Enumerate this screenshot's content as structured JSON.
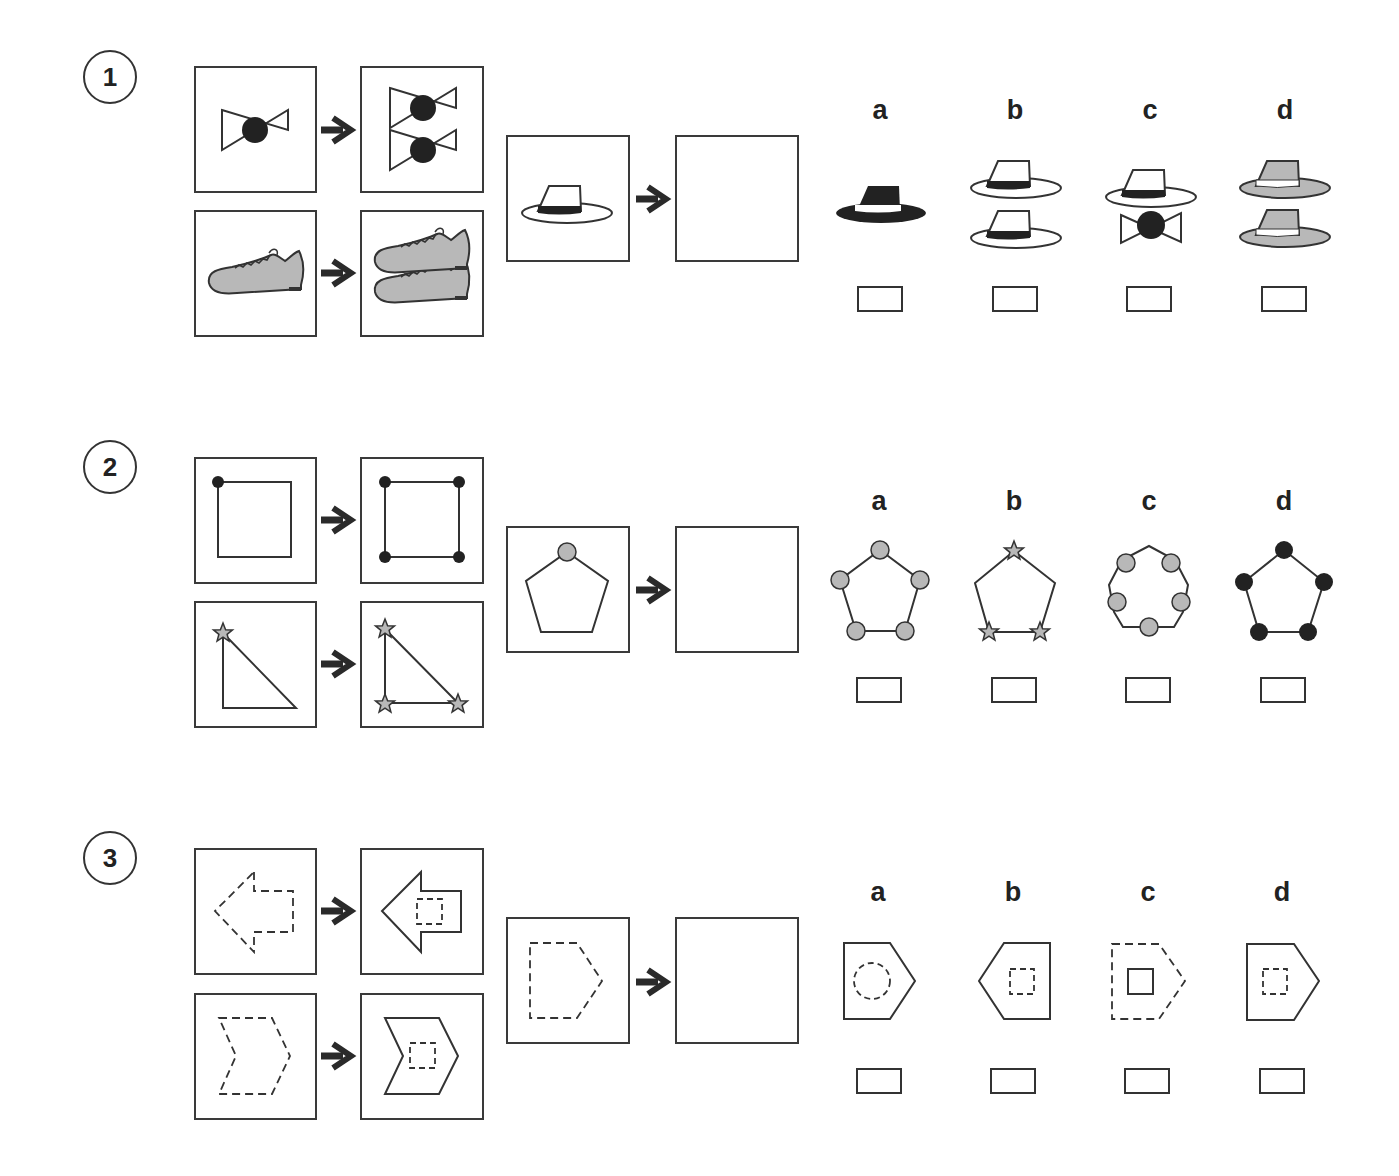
{
  "colors": {
    "stroke": "#333333",
    "black_fill": "#222222",
    "gray_fill": "#b8b8b8",
    "background": "#ffffff"
  },
  "questions": [
    {
      "number": "1",
      "examples": [
        {
          "from": "bow-tie",
          "to": "two bow-ties stacked"
        },
        {
          "from": "shoe",
          "to": "two shoes stacked"
        }
      ],
      "prompt": {
        "from": "white hat with black band",
        "to": ""
      },
      "options": [
        {
          "label": "a",
          "description": "single black hat with white band"
        },
        {
          "label": "b",
          "description": "two white hats with black bands stacked"
        },
        {
          "label": "c",
          "description": "white hat on top of bow-tie"
        },
        {
          "label": "d",
          "description": "two gray hats with white bands stacked"
        }
      ]
    },
    {
      "number": "2",
      "examples": [
        {
          "from": "square with black dot on one corner",
          "to": "square with black dots on all four corners"
        },
        {
          "from": "right triangle with gray star on one corner",
          "to": "right triangle with gray stars on all three corners"
        }
      ],
      "prompt": {
        "from": "pentagon with gray circle on top vertex",
        "to": ""
      },
      "options": [
        {
          "label": "a",
          "description": "pentagon with gray circles on all five vertices"
        },
        {
          "label": "b",
          "description": "pentagon with gray stars on three vertices"
        },
        {
          "label": "c",
          "description": "heptagon with gray circles on edges"
        },
        {
          "label": "d",
          "description": "pentagon with black circles on all five vertices"
        }
      ]
    },
    {
      "number": "3",
      "examples": [
        {
          "from": "dashed left arrow",
          "to": "solid left arrow with small dashed square inside"
        },
        {
          "from": "dashed chevron",
          "to": "solid chevron with small dashed square inside"
        }
      ],
      "prompt": {
        "from": "dashed pentagon pointing right",
        "to": ""
      },
      "options": [
        {
          "label": "a",
          "description": "solid pentagon with dashed circle inside"
        },
        {
          "label": "b",
          "description": "solid pentagon pointing left with dashed square inside"
        },
        {
          "label": "c",
          "description": "dashed pentagon with solid square inside"
        },
        {
          "label": "d",
          "description": "solid pentagon pointing right with dashed square inside"
        }
      ]
    }
  ]
}
